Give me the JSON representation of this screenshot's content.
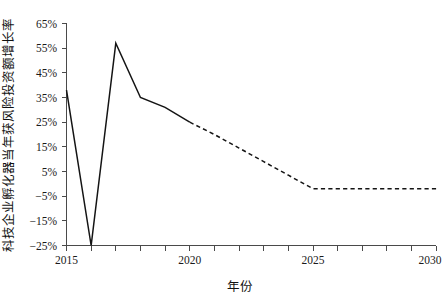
{
  "chart_data": {
    "type": "line",
    "title": "",
    "xlabel": "年份",
    "ylabel": "科技企业孵化器当年获风险投资额增长率",
    "xlim": [
      2015,
      2030.5
    ],
    "ylim": [
      -25,
      65
    ],
    "grid": false,
    "legend": "none",
    "x_major_ticks": [
      2015,
      2020,
      2025,
      2030
    ],
    "x_major_tick_labels": [
      "2015",
      "2020",
      "2025",
      "2030"
    ],
    "x_minor_ticks": [
      2016,
      2017,
      2018,
      2019,
      2021,
      2022,
      2023,
      2024,
      2026,
      2027,
      2028,
      2029
    ],
    "y_ticks": [
      65,
      55,
      45,
      35,
      25,
      15,
      5,
      -5,
      -15,
      -25
    ],
    "y_tick_labels": [
      "65%",
      "55%",
      "45%",
      "35%",
      "25%",
      "15%",
      "5%",
      "−5%",
      "−15%",
      "−25%"
    ],
    "series": [
      {
        "name": "实际值",
        "style": "solid",
        "color": "#141414",
        "x": [
          2015,
          2016,
          2017,
          2018,
          2019,
          2020
        ],
        "values": [
          38,
          -25,
          57,
          35,
          31,
          25
        ]
      },
      {
        "name": "预测值",
        "style": "dashed",
        "color": "#141414",
        "x": [
          2020,
          2021,
          2022,
          2023,
          2024,
          2025,
          2026,
          2027,
          2028,
          2029,
          2030
        ],
        "values": [
          25,
          20,
          14.5,
          9,
          3.5,
          -2,
          -2,
          -2,
          -2,
          -2,
          -2
        ]
      }
    ]
  },
  "axis": {
    "x_title": "年份",
    "y_title": "科技企业孵化器当年获风险投资额增长率",
    "y_labels": [
      "65%",
      "55%",
      "45%",
      "35%",
      "25%",
      "15%",
      "5%",
      "−5%",
      "−15%",
      "−25%"
    ],
    "x_labels": [
      "2015",
      "2020",
      "2025",
      "2030"
    ]
  }
}
